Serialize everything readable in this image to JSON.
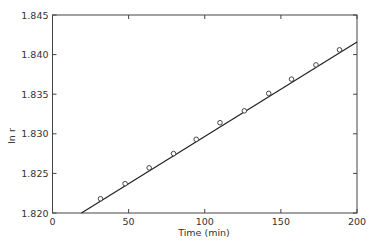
{
  "chart_data": {
    "type": "scatter",
    "title": "",
    "xlabel": "Time (min)",
    "ylabel": "ln r",
    "xlim": [
      0,
      200
    ],
    "ylim": [
      1.82,
      1.845
    ],
    "xticks": [
      0,
      50,
      100,
      150,
      200
    ],
    "xtick_labels": [
      "0",
      "50",
      "100",
      "150",
      "200"
    ],
    "yticks": [
      1.82,
      1.825,
      1.83,
      1.835,
      1.84,
      1.845
    ],
    "ytick_labels": [
      "1.820",
      "1.825",
      "1.830",
      "1.835",
      "1.840",
      "1.845"
    ],
    "grid": false,
    "legend": null,
    "series": [
      {
        "name": "measured",
        "marker": "open-circle",
        "x": [
          31.5,
          47.7,
          63.5,
          79.5,
          94.4,
          110,
          126,
          142,
          157,
          173,
          188.5
        ],
        "y": [
          1.8218,
          1.8237,
          1.8257,
          1.8275,
          1.8293,
          1.8314,
          1.8329,
          1.8351,
          1.8369,
          1.8387,
          1.8406
        ]
      },
      {
        "name": "linear fit",
        "marker": "line",
        "x": [
          19,
          200
        ],
        "y": [
          1.82,
          1.8416
        ]
      }
    ]
  }
}
